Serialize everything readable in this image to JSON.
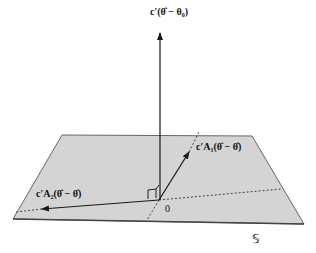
{
  "diagram": {
    "labels": {
      "vertical_vector": "c′(θ̂ − θ₀)",
      "vector_a1": "c′A₁(θ̂ − θ̂)",
      "vector_a2": "c′A₂(θ̂ − θ̂)",
      "origin": "0",
      "plane": "𝕊"
    },
    "colors": {
      "plane_fill": "#d4d4d4",
      "plane_edge": "#555555",
      "vector": "#1a1a1a",
      "dotted": "#444444"
    }
  }
}
